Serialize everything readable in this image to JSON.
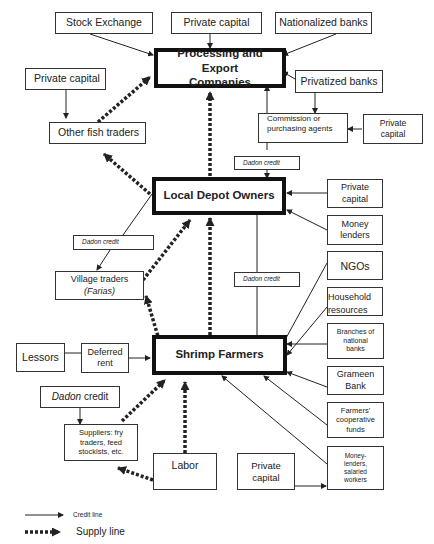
{
  "diagram": {
    "nodes": {
      "stock_exchange": "Stock Exchange",
      "private_capital_top": "Private capital",
      "nationalized_banks": "Nationalized banks",
      "processing_export_line1": "Processing and Export",
      "processing_export_line2": "Companies",
      "private_capital_left": "Private capital",
      "privatized_banks": "Privatized banks",
      "other_fish_traders": "Other fish traders",
      "commission_agents_line1": "Commission or",
      "commission_agents_line2": "purchasing agents",
      "private_capital_right_line1": "Private",
      "private_capital_right_line2": "capital",
      "dadon_credit_depot": "Dadon credit",
      "local_depot_owners": "Local Depot Owners",
      "private_capital_depot_line1": "Private",
      "private_capital_depot_line2": "capital",
      "money_lenders_line1": "Money",
      "money_lenders_line2": "lenders",
      "dadon_credit_village": "Dadon credit",
      "village_traders_line1": "Village traders",
      "village_traders_line2": "(Farias)",
      "dadon_credit_farmers": "Dadon credit",
      "ngos": "NGOs",
      "household_line1": "Household",
      "household_line2": "resources",
      "branches_line1": "Branches of",
      "branches_line2": "national",
      "branches_line3": "banks",
      "lessors": "Lessors",
      "deferred_rent_line1": "Deferred",
      "deferred_rent_line2": "rent",
      "shrimp_farmers": "Shrimp Farmers",
      "grameen_line1": "Grameen",
      "grameen_line2": "Bank",
      "dadon_credit_suppliers_italic": "Dadon",
      "dadon_credit_suppliers_rest": " credit",
      "farmers_coop_line1": "Farmers'",
      "farmers_coop_line2": "cooperative",
      "farmers_coop_line3": "funds",
      "suppliers_line1": "Suppliers: fry",
      "suppliers_line2": "traders, feed",
      "suppliers_line3": "stockists, etc.",
      "labor": "Labor",
      "private_capital_bottom_line1": "Private",
      "private_capital_bottom_line2": "capital",
      "moneylenders_salaried_line1": "Money-",
      "moneylenders_salaried_line2": "lenders,",
      "moneylenders_salaried_line3": "salaried",
      "moneylenders_salaried_line4": "workers"
    },
    "legend": {
      "credit_line": "Credit line",
      "supply_line": "Supply line"
    },
    "colors": {
      "line": "#222222",
      "box_border": "#333333",
      "main_border": "#111111"
    }
  }
}
